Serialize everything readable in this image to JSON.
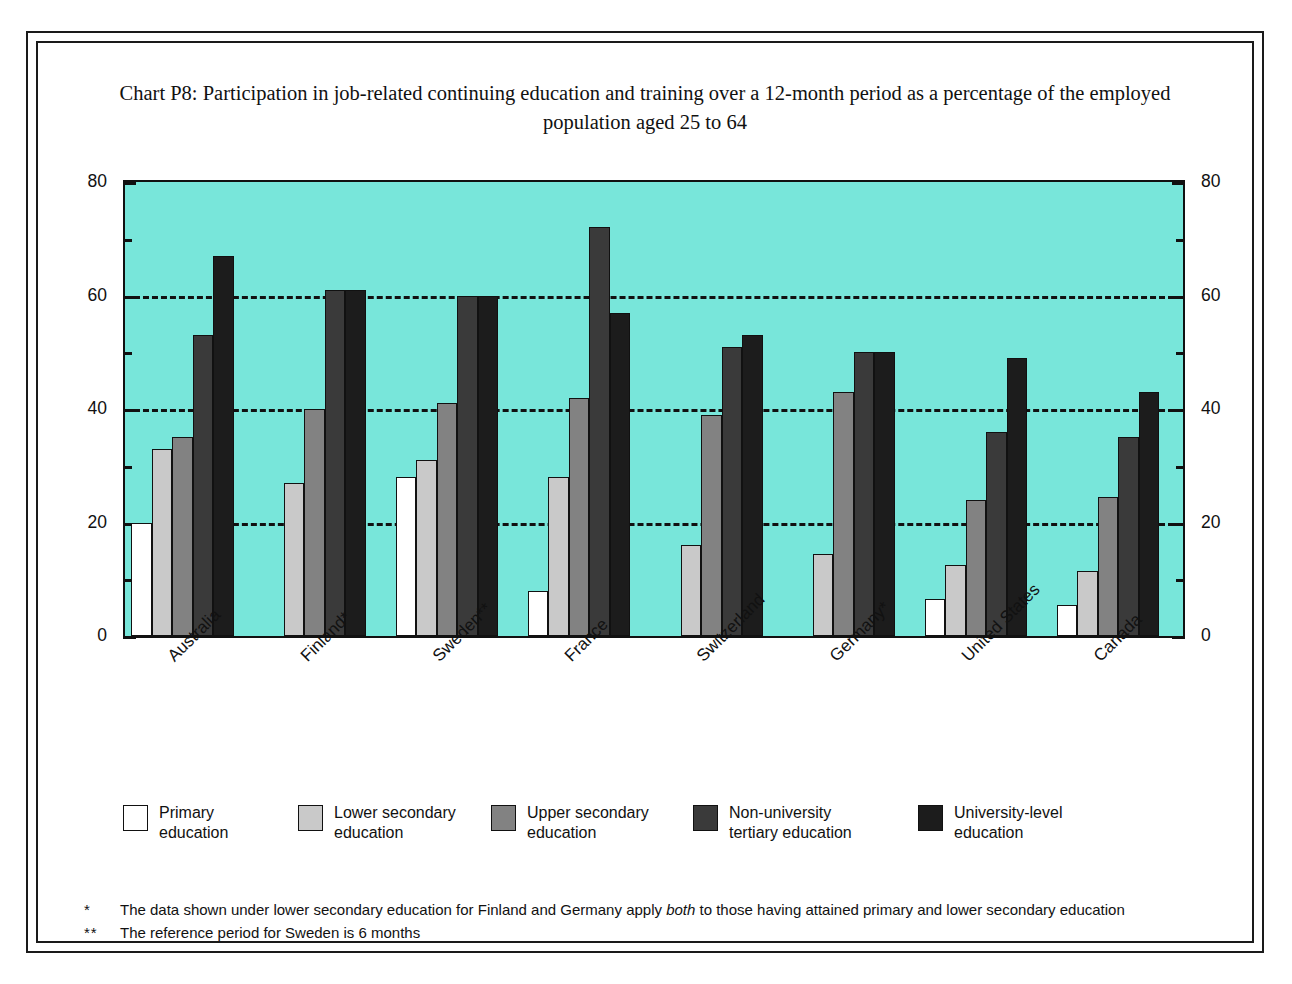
{
  "chart_data": {
    "type": "bar",
    "title": "Chart P8: Participation in job-related continuing education and training over a 12-month period as a percentage of the employed population aged 25 to 64",
    "xlabel": "",
    "ylabel": "",
    "ylim": [
      0,
      80
    ],
    "yticks": [
      0,
      20,
      40,
      60,
      80
    ],
    "yminorticks": [
      10,
      30,
      50,
      70
    ],
    "grid": "horizontal dashed at 20, 40, 60",
    "legend_position": "bottom",
    "plot_background": "#78e6da",
    "categories": [
      "Australia",
      "Finland*",
      "Sweden**",
      "France",
      "Switzerland",
      "Germany*",
      "United States",
      "Canada"
    ],
    "series": [
      {
        "name": "Primary education",
        "color": "#ffffff",
        "values": [
          20,
          null,
          28,
          8,
          null,
          null,
          6.5,
          5.5
        ]
      },
      {
        "name": "Lower secondary education",
        "color": "#c9c9c9",
        "values": [
          33,
          27,
          31,
          28,
          16,
          14.5,
          12.5,
          11.5
        ]
      },
      {
        "name": "Upper secondary education",
        "color": "#828282",
        "values": [
          35,
          40,
          41,
          42,
          39,
          43,
          24,
          24.5
        ]
      },
      {
        "name": "Non-university tertiary education",
        "color": "#3a3a3a",
        "values": [
          53,
          61,
          60,
          72,
          51,
          50,
          36,
          35
        ]
      },
      {
        "name": "University-level education",
        "color": "#1c1c1c",
        "values": [
          67,
          61,
          60,
          57,
          53,
          50,
          49,
          43
        ]
      }
    ]
  },
  "axis": {
    "left_labels": [
      "80",
      "60",
      "40",
      "20",
      "0"
    ],
    "right_labels": [
      "80",
      "60",
      "40",
      "20",
      "0"
    ]
  },
  "legend": {
    "items": [
      {
        "label": "Primary\neducation",
        "color": "#ffffff"
      },
      {
        "label": "Lower secondary\neducation",
        "color": "#c9c9c9"
      },
      {
        "label": "Upper secondary\neducation",
        "color": "#828282"
      },
      {
        "label": "Non-university\ntertiary education",
        "color": "#3a3a3a"
      },
      {
        "label": "University-level\neducation",
        "color": "#1c1c1c"
      }
    ]
  },
  "footnotes": [
    {
      "marker": "*",
      "text_before": "The data shown under lower secondary education for Finland and Germany apply ",
      "emphasis": "both",
      "text_after": " to those having attained primary and lower secondary education"
    },
    {
      "marker": "**",
      "text_before": "The reference period for Sweden is 6 months",
      "emphasis": "",
      "text_after": ""
    }
  ]
}
